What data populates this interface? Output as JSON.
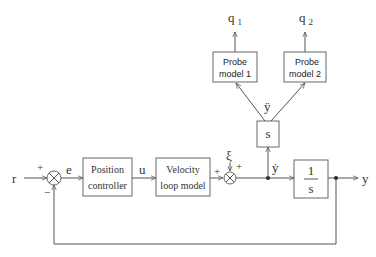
{
  "diagram": {
    "type": "block-diagram",
    "colors": {
      "line": "#555555",
      "box_border": "#666666",
      "text": "#333333",
      "background": "#ffffff"
    },
    "signals": {
      "reference": "r",
      "error": "e",
      "control": "u",
      "disturbance": "ξ",
      "velocity": "ẏ",
      "acceleration": "ÿ",
      "output": "y",
      "probe_out_1": "q",
      "probe_out_1_sub": "1",
      "probe_out_2": "q",
      "probe_out_2_sub": "2"
    },
    "signs": {
      "sum1_top": "+",
      "sum1_bottom": "−",
      "sum2_left": "+",
      "sum2_top": "+"
    },
    "blocks": {
      "position_controller": {
        "line1": "Position",
        "line2": "controller"
      },
      "velocity_loop": {
        "line1": "Velocity",
        "line2": "loop model"
      },
      "differentiator": {
        "label": "s"
      },
      "integrator": {
        "numerator": "1",
        "denominator": "s"
      },
      "probe1": {
        "line1": "Probe",
        "line2": "model 1"
      },
      "probe2": {
        "line1": "Probe",
        "line2": "model 2"
      }
    },
    "summing_junction_glyph": "×"
  }
}
